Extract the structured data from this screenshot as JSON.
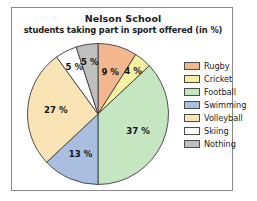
{
  "chart_data": {
    "type": "pie",
    "title": "Nelson School",
    "subtitle": "students taking part in sport offered (in %)",
    "xlabel": "",
    "ylabel": "",
    "legend_position": "right",
    "grid": false,
    "unit": "%",
    "categories": [
      "Rugby",
      "Cricket",
      "Football",
      "Swimming",
      "Volleyball",
      "Skiing",
      "Nothing"
    ],
    "values": [
      9,
      4,
      37,
      13,
      27,
      5,
      5
    ],
    "labels": [
      "9 %",
      "4 %",
      "37 %",
      "13 %",
      "27 %",
      "5 %",
      "5 %"
    ],
    "colors": [
      "#f2b78d",
      "#f6f1a0",
      "#c6e6c2",
      "#aabfdf",
      "#fae3b4",
      "#ffffff",
      "#bfbfbf"
    ],
    "slices": [
      {
        "name": "Rugby",
        "value": 9,
        "label": "9 %",
        "color": "#f2b78d"
      },
      {
        "name": "Cricket",
        "value": 4,
        "label": "4 %",
        "color": "#f6f1a0"
      },
      {
        "name": "Football",
        "value": 37,
        "label": "37 %",
        "color": "#c6e6c2"
      },
      {
        "name": "Swimming",
        "value": 13,
        "label": "13 %",
        "color": "#aabfdf"
      },
      {
        "name": "Volleyball",
        "value": 27,
        "label": "27 %",
        "color": "#fae3b4"
      },
      {
        "name": "Skiing",
        "value": 5,
        "label": "5 %",
        "color": "#ffffff"
      },
      {
        "name": "Nothing",
        "value": 5,
        "label": "5 %",
        "color": "#bfbfbf"
      }
    ]
  },
  "legend": {
    "items": [
      {
        "label": "Rugby",
        "color": "#f2b78d"
      },
      {
        "label": "Cricket",
        "color": "#f6f1a0"
      },
      {
        "label": "Football",
        "color": "#c6e6c2"
      },
      {
        "label": "Swimming",
        "color": "#aabfdf"
      },
      {
        "label": "Volleyball",
        "color": "#fae3b4"
      },
      {
        "label": "Skiing",
        "color": "#ffffff"
      },
      {
        "label": "Nothing",
        "color": "#bfbfbf"
      }
    ]
  },
  "frame": {
    "border_color": "#8a8a8a",
    "background": "#ffffff"
  }
}
